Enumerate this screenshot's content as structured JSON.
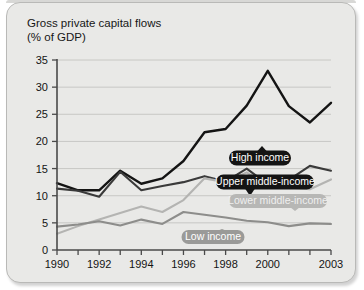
{
  "panel": {
    "background_color": "#e9e9e7",
    "border_color": "#b9b9b7"
  },
  "chart_data": {
    "type": "line",
    "title": "Gross private capital flows",
    "subtitle": "(% of GDP)",
    "xlabel": "",
    "ylabel": "",
    "ylim": [
      0,
      35
    ],
    "yticks": [
      0,
      5,
      10,
      15,
      20,
      25,
      30,
      35
    ],
    "ytick_labels": [
      "0",
      "5",
      "10",
      "15",
      "20",
      "25",
      "30",
      "35"
    ],
    "xlim": [
      1990,
      2003
    ],
    "x": [
      1990,
      1991,
      1992,
      1993,
      1994,
      1995,
      1996,
      1997,
      1998,
      1999,
      2000,
      2001,
      2002,
      2003
    ],
    "xticks": [
      1990,
      1991,
      1992,
      1993,
      1994,
      1995,
      1996,
      1997,
      1998,
      1999,
      2000,
      2001,
      2002,
      2003
    ],
    "xtick_labels": [
      "1990",
      "",
      "1992",
      "",
      "1994",
      "",
      "1996",
      "",
      "1998",
      "",
      "2000",
      "",
      "",
      "2003"
    ],
    "grid": true,
    "grid_axis": "y",
    "legend_position": "inline-callouts",
    "series": [
      {
        "name": "High income",
        "color": "#141414",
        "width": 2.4,
        "values": [
          12.3,
          11.0,
          11.0,
          14.6,
          12.2,
          13.2,
          16.4,
          21.7,
          22.3,
          26.6,
          33.0,
          26.5,
          23.5,
          27.1
        ]
      },
      {
        "name": "Upper middle-income",
        "color": "#3a3a3a",
        "width": 2.1,
        "values": [
          11.3,
          10.9,
          9.8,
          14.4,
          11.0,
          11.8,
          12.5,
          13.6,
          12.6,
          15.0,
          12.1,
          12.9,
          15.5,
          14.6
        ]
      },
      {
        "name": "Lower middle-income",
        "color": "#b4b4b2",
        "width": 2.1,
        "values": [
          3.0,
          4.4,
          5.6,
          6.8,
          8.0,
          7.0,
          9.2,
          13.2,
          12.5,
          14.3,
          11.8,
          11.5,
          11.2,
          13.0
        ]
      },
      {
        "name": "Low income",
        "color": "#8d8d8b",
        "width": 2.1,
        "values": [
          4.3,
          4.7,
          5.3,
          4.5,
          5.6,
          4.8,
          7.0,
          6.5,
          6.0,
          5.4,
          5.1,
          4.4,
          4.9,
          4.8
        ]
      }
    ],
    "annotations": [
      {
        "label": "High income",
        "pill_color": "#141414",
        "text_color": "#ffffff",
        "cx": 260,
        "cy": 158,
        "w": 62,
        "h": 15,
        "tail_x": 262,
        "tail_y": 146
      },
      {
        "label": "Upper middle-income",
        "pill_color": "#141414",
        "text_color": "#ffffff",
        "cx": 265,
        "cy": 182,
        "w": 98,
        "h": 15,
        "tail_x": 250,
        "tail_y": 196
      },
      {
        "label": "Lower middle-income",
        "pill_color": "#b7b7b5",
        "text_color": "#efefef",
        "cx": 278,
        "cy": 201,
        "w": 98,
        "h": 14,
        "tail_x": 295,
        "tail_y": 211
      },
      {
        "label": "Low income",
        "pill_color": "#9a9a98",
        "text_color": "#ffffff",
        "cx": 213,
        "cy": 237,
        "w": 63,
        "h": 14,
        "tail_x": 222,
        "tail_y": 229
      }
    ]
  }
}
